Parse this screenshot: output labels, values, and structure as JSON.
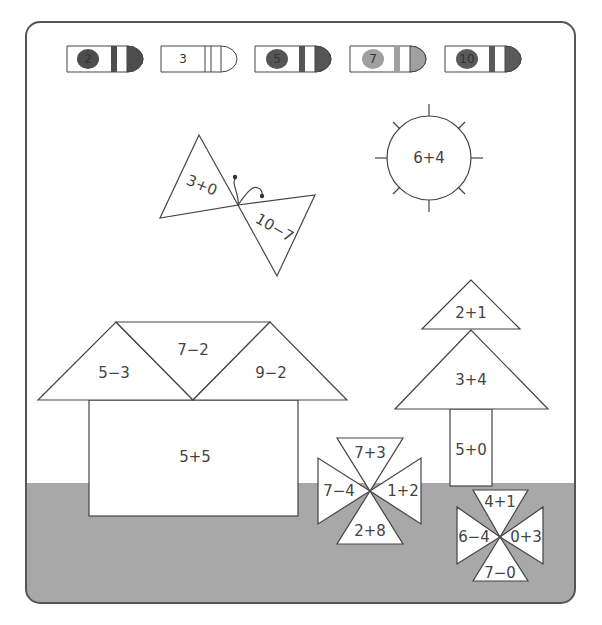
{
  "colors": {
    "frame_stroke": "#555555",
    "ground": "#a8a8a8",
    "shape_fill": "#ffffff",
    "shape_stroke": "#444444",
    "text": "#444444"
  },
  "crayons": [
    {
      "number": "2",
      "color": "#4d4d4d",
      "filled": true
    },
    {
      "number": "3",
      "color": "#ffffff",
      "filled": false
    },
    {
      "number": "5",
      "color": "#555555",
      "filled": true
    },
    {
      "number": "7",
      "color": "#a0a0a0",
      "filled": true
    },
    {
      "number": "10",
      "color": "#5a5a5a",
      "filled": true
    }
  ],
  "butterfly": {
    "left_wing": "3+0",
    "right_wing": "10−7"
  },
  "sun": {
    "label": "6+4"
  },
  "house": {
    "roof_left": "5−3",
    "roof_middle": "7−2",
    "roof_right": "9−2",
    "body": "5+5"
  },
  "tree": {
    "top": "2+1",
    "middle": "3+4",
    "trunk": "5+0"
  },
  "flower_left": {
    "top": "7+3",
    "left": "7−4",
    "right": "1+2",
    "bottom": "2+8"
  },
  "flower_right": {
    "top": "4+1",
    "left": "6−4",
    "right": "0+3",
    "bottom": "7−0"
  }
}
